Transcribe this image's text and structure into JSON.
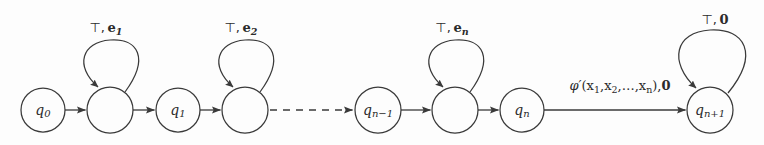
{
  "figure": {
    "kind": "state-transition-diagram",
    "background_color": "#fdfdfd",
    "stroke_color": "#3a3a3a",
    "text_color": "#2b2b2b",
    "width": 764,
    "height": 145
  },
  "nodes": [
    {
      "id": "q0",
      "label": "q",
      "sub": "0",
      "cx": 43,
      "cy": 110,
      "r": 22
    },
    {
      "id": "aux1",
      "label": "",
      "sub": "",
      "cx": 110,
      "cy": 110,
      "r": 23
    },
    {
      "id": "q1",
      "label": "q",
      "sub": "1",
      "cx": 178,
      "cy": 110,
      "r": 22
    },
    {
      "id": "aux2",
      "label": "",
      "sub": "",
      "cx": 245,
      "cy": 110,
      "r": 23
    },
    {
      "id": "qn-1",
      "label": "q",
      "sub": "n−1",
      "cx": 378,
      "cy": 110,
      "r": 23
    },
    {
      "id": "auxn",
      "label": "",
      "sub": "",
      "cx": 455,
      "cy": 110,
      "r": 23
    },
    {
      "id": "qn",
      "label": "q",
      "sub": "n",
      "cx": 522,
      "cy": 110,
      "r": 22
    },
    {
      "id": "qn+1",
      "label": "q",
      "sub": "n+1",
      "cx": 710,
      "cy": 110,
      "r": 23
    }
  ],
  "self_loops": [
    {
      "for": "aux1",
      "label_top": "⊤,",
      "label_bold": "e",
      "label_sub": "1",
      "label_x": 106,
      "label_y": 32
    },
    {
      "for": "aux2",
      "label_top": "⊤,",
      "label_bold": "e",
      "label_sub": "2",
      "label_x": 241,
      "label_y": 32
    },
    {
      "for": "auxn",
      "label_top": "⊤,",
      "label_bold": "e",
      "label_sub": "n",
      "label_x": 452,
      "label_y": 32
    },
    {
      "for": "qn+1",
      "label_top": "⊤,",
      "label_bold": "0",
      "label_sub": "",
      "label_x": 715,
      "label_y": 24
    }
  ],
  "edges": [
    {
      "from": "q0",
      "to": "aux1",
      "style": "solid",
      "label": ""
    },
    {
      "from": "aux1",
      "to": "q1",
      "style": "solid",
      "label": ""
    },
    {
      "from": "q1",
      "to": "aux2",
      "style": "solid",
      "label": ""
    },
    {
      "from": "aux2",
      "to": "qn-1",
      "style": "dashed",
      "label": ""
    },
    {
      "from": "qn-1",
      "to": "auxn",
      "style": "solid",
      "label": ""
    },
    {
      "from": "auxn",
      "to": "qn",
      "style": "solid",
      "label": ""
    },
    {
      "from": "qn",
      "to": "qn+1",
      "style": "solid",
      "label": "phi-prime-transition"
    }
  ],
  "transition_label": {
    "phi": "φ′",
    "open_paren": "(",
    "args": [
      "x",
      "x",
      "x"
    ],
    "arg_subs": [
      "1",
      "2",
      "n"
    ],
    "ellipsis": ", … ,",
    "close_paren": "),",
    "output": "0",
    "full_text": "φ′(x₁,x₂,…,xₙ),0",
    "x": 620,
    "y": 90
  },
  "labels": {
    "top_symbol": "⊤",
    "comma": ",",
    "vector_e": "e",
    "zero_vector": "0",
    "loop1_text": "⊤, e₁",
    "loop2_text": "⊤, e₂",
    "loopn_text": "⊤, eₙ",
    "loop_final_text": "⊤, 0"
  }
}
